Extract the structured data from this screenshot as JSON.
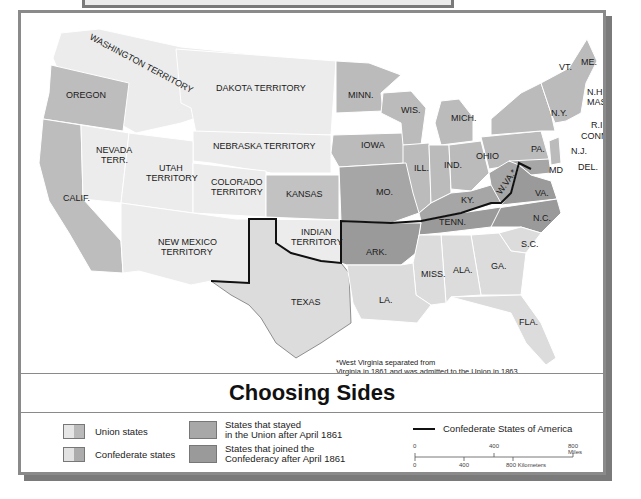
{
  "title": "Choosing Sides",
  "footnote": {
    "marker": "*",
    "line1": "West Virginia separated from",
    "line2": "Virginia in 1861 and was admitted to the Union in 1863."
  },
  "colors": {
    "union_light": "#e6e6e6",
    "union_dark": "#b9b9b9",
    "confederate_light": "#dedede",
    "confederate_dark": "#a9a9a9",
    "stayed_union": "#a8a8a8",
    "joined_confederacy": "#9a9a9a",
    "territory": "#ececec",
    "csa_border": "#111111",
    "frame": "#8a8a8a"
  },
  "legend": {
    "items": [
      {
        "label": "Union states",
        "type": "split-swatch"
      },
      {
        "label": "Confederate states",
        "type": "split-swatch"
      },
      {
        "label_line1": "States that stayed",
        "label_line2": "in the Union after April 1861",
        "type": "solid-swatch"
      },
      {
        "label_line1": "States that joined the",
        "label_line2": "Confederacy after April 1861",
        "type": "solid-swatch"
      },
      {
        "label": "Confederate States of America",
        "type": "line"
      }
    ],
    "union": "Union states",
    "confederate": "Confederate states",
    "stayed_1": "States that stayed",
    "stayed_2": "in the Union after April 1861",
    "joined_1": "States that joined the",
    "joined_2": "Confederacy after April 1861",
    "csa": "Confederate States of America"
  },
  "scale": {
    "miles_ticks": [
      "0",
      "400",
      "800 Miles"
    ],
    "km_ticks": [
      "0",
      "400",
      "800 Kilometers"
    ]
  },
  "map_labels": {
    "washington": "WASHINGTON TERRITORY",
    "oregon": "OREGON",
    "dakota": "DAKOTA TERRITORY",
    "nebraska": "NEBRASKA TERRITORY",
    "nevada_1": "NEVADA",
    "nevada_2": "TERR.",
    "utah_1": "UTAH",
    "utah_2": "TERRITORY",
    "colorado_1": "COLORADO",
    "colorado_2": "TERRITORY",
    "calif": "CALIF.",
    "kansas": "KANSAS",
    "new_mexico_1": "NEW MEXICO",
    "new_mexico_2": "TERRITORY",
    "indian_1": "INDIAN",
    "indian_2": "TERRITORY",
    "texas": "TEXAS",
    "minn": "MINN.",
    "wis": "WIS.",
    "mich": "MICH.",
    "iowa": "IOWA",
    "ill": "ILL.",
    "ind": "IND.",
    "ohio": "OHIO",
    "mo": "MO.",
    "ky": "KY.",
    "ark": "ARK.",
    "tenn": "TENN.",
    "miss": "MISS.",
    "ala": "ALA.",
    "ga": "GA.",
    "la": "LA.",
    "fla": "FLA.",
    "sc": "S.C.",
    "nc": "N.C.",
    "va": "VA.",
    "wva": "W.VA.*",
    "md": "MD",
    "del": "DEL.",
    "nj": "N.J.",
    "pa": "PA.",
    "ny": "N.Y.",
    "vt": "VT.",
    "me": "ME.",
    "nh": "N.H.",
    "mass": "MASS.",
    "ri": "R.I.",
    "conn": "CONN."
  }
}
